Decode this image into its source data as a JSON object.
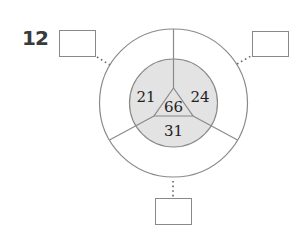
{
  "problem": {
    "number": "12"
  },
  "diagram": {
    "center_value": "66",
    "sectors": [
      {
        "position": "upper-left",
        "value": "21"
      },
      {
        "position": "upper-right",
        "value": "24"
      },
      {
        "position": "bottom",
        "value": "31"
      }
    ],
    "answer_boxes": [
      {
        "position": "top-left",
        "value": ""
      },
      {
        "position": "top-right",
        "value": ""
      },
      {
        "position": "bottom",
        "value": ""
      }
    ],
    "colors": {
      "inner_fill": "#e3e3e3",
      "stroke": "#8a8a8a",
      "text": "#222222"
    }
  }
}
